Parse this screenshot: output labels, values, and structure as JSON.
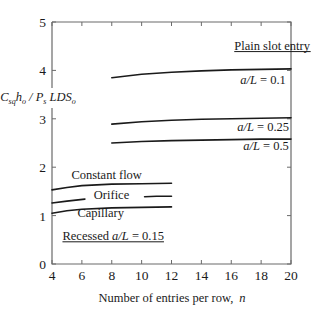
{
  "chart_data": {
    "type": "line",
    "title": "",
    "xlabel": "Number of entries per row,  n",
    "ylabel": "C_sq h_o / P_s LDS_o",
    "xlim": [
      4,
      20
    ],
    "ylim": [
      0,
      5
    ],
    "xticks": [
      4,
      6,
      8,
      10,
      12,
      14,
      16,
      18,
      20
    ],
    "yticks": [
      0,
      1,
      2,
      3,
      4,
      5
    ],
    "grid": false,
    "legend": "inline labels",
    "groups": [
      {
        "label": "Plain slot entry",
        "underlined": true
      },
      {
        "label": "Recessed  a/L = 0.15",
        "underlined": true
      }
    ],
    "series": [
      {
        "name": "a/L = 0.1",
        "group": "Plain slot entry",
        "x": [
          8,
          10,
          12,
          14,
          16,
          18,
          20
        ],
        "y": [
          3.85,
          3.92,
          3.96,
          3.99,
          4.01,
          4.02,
          4.03
        ]
      },
      {
        "name": "a/L = 0.25",
        "group": "Plain slot entry",
        "x": [
          8,
          10,
          12,
          14,
          16,
          18,
          20
        ],
        "y": [
          2.89,
          2.94,
          2.97,
          2.99,
          3.0,
          3.01,
          3.02
        ]
      },
      {
        "name": "a/L = 0.5",
        "group": "Plain slot entry",
        "x": [
          8,
          10,
          12,
          14,
          16,
          18,
          20
        ],
        "y": [
          2.5,
          2.53,
          2.55,
          2.56,
          2.57,
          2.58,
          2.58
        ]
      },
      {
        "name": "Constant flow",
        "group": "Recessed  a/L = 0.15",
        "x": [
          4,
          5,
          6,
          8,
          10,
          12
        ],
        "y": [
          1.53,
          1.58,
          1.62,
          1.65,
          1.66,
          1.67
        ]
      },
      {
        "name": "Orifice",
        "group": "Recessed  a/L = 0.15",
        "segments": [
          {
            "x": [
              4,
              5,
              6.2
            ],
            "y": [
              1.26,
              1.3,
              1.34
            ]
          },
          {
            "x": [
              10.2,
              11,
              12
            ],
            "y": [
              1.39,
              1.4,
              1.4
            ]
          }
        ]
      },
      {
        "name": "Capillary",
        "group": "Recessed  a/L = 0.15",
        "x": [
          4,
          5,
          6,
          8,
          10,
          12
        ],
        "y": [
          1.05,
          1.1,
          1.13,
          1.16,
          1.17,
          1.18
        ]
      }
    ],
    "annotations": [
      {
        "text": "Plain slot entry",
        "x": 16.2,
        "y": 4.43,
        "underline": true
      },
      {
        "text": "a/L = 0.1",
        "x": 16.6,
        "y": 3.72
      },
      {
        "text": "a/L = 0.25",
        "x": 16.4,
        "y": 2.74
      },
      {
        "text": "a/L = 0.5",
        "x": 16.8,
        "y": 2.35
      },
      {
        "text": "Constant flow",
        "x": 5.3,
        "y": 1.75
      },
      {
        "text": "Orifice",
        "x": 6.8,
        "y": 1.35
      },
      {
        "text": "Capillary",
        "x": 5.7,
        "y": 0.97
      },
      {
        "text": "Recessed  a/L = 0.15",
        "x": 4.7,
        "y": 0.5,
        "underline": true
      }
    ]
  },
  "axes": {
    "xlabel_text": "Number of entries per row,",
    "xlabel_var": "n"
  }
}
